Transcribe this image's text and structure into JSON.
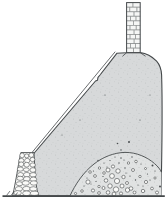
{
  "figure": {
    "subject": "Cross-section illustration of a stippled earthen kiln mound with a brick chimney at its summit",
    "style": "engraving-style line drawing, no text",
    "parts": {
      "chimney": "brick chimney stack at the summit",
      "mound": "large stippled earthen mound with a straight left slope",
      "slope_lining": "thin lining line parallel to the left slope",
      "retaining_wall": "rubble stone retaining wall at the lower left",
      "inner_dome": "domed inner core filled with loose stones and rubble",
      "ground_line": "horizontal ground baseline"
    },
    "colors": {
      "background": "#ffffff",
      "mound_fill": "#d7d9da",
      "inner_dome_fill": "#e0e2e2",
      "outline": "#44484a",
      "brick_fill": "#f5f6f5",
      "stone_fill": "#fafaf8",
      "speck": "#4a4e50",
      "stipple": "#a8adaf"
    }
  }
}
